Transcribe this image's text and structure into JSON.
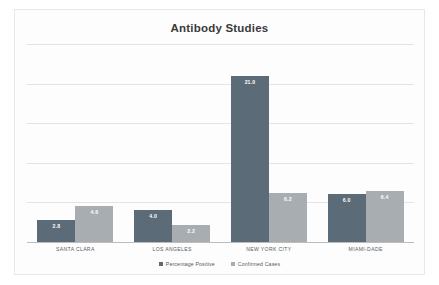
{
  "chart_data": {
    "type": "bar",
    "title": "Antibody Studies",
    "xlabel": "",
    "ylabel": "",
    "ylim": [
      0,
      25
    ],
    "grid": true,
    "legend_position": "bottom",
    "categories": [
      "SANTA CLARA",
      "LOS ANGELES",
      "NEW YORK CITY",
      "MIAMI-DADE"
    ],
    "series": [
      {
        "name": "Percentage Positive",
        "color": "#5b6b77",
        "values": [
          2.8,
          4.0,
          21.0,
          6.0
        ],
        "labels": [
          "2.8",
          "4.0",
          "21.0",
          "6.0"
        ]
      },
      {
        "name": "Confirmed Cases",
        "color": "#a7adb0",
        "values": [
          4.6,
          2.2,
          6.2,
          6.4
        ],
        "labels": [
          "4.6",
          "2.2",
          "6.2",
          "6.4"
        ]
      }
    ],
    "gridline_values": [
      5,
      10,
      15,
      20,
      25
    ]
  },
  "colors": {
    "series1": "#5b6b77",
    "series2": "#a7adb0",
    "gridline": "#e4e4e4",
    "axis": "#bcbcbc",
    "title": "#3a3a3a",
    "frame": "#e8e8e8",
    "background": "#fdfdfd"
  }
}
